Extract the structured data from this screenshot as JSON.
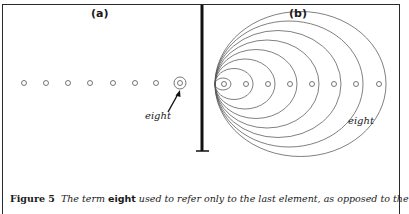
{
  "figure": {
    "panel_a": {
      "label": "(a)",
      "annotation": "eight",
      "element_count": 8,
      "highlighted_index": 7,
      "circles_x": [
        24,
        46,
        68,
        90,
        113,
        135,
        156,
        180
      ],
      "circles_y": 83
    },
    "panel_b": {
      "label": "(b)",
      "annotation": "eight",
      "element_count": 8,
      "circles_x": [
        224,
        246,
        268,
        290,
        312,
        334,
        356,
        379
      ],
      "circles_y": 84,
      "ellipse_origin_x": 215
    },
    "caption": {
      "figure_number": "Figure 5",
      "text_before": "The term ",
      "term": "eight",
      "text_after": " used to refer only to the last element, as opposed to the"
    },
    "colors": {
      "line": "#555555",
      "frame": "#2a2a2a",
      "divider": "#111111"
    }
  }
}
